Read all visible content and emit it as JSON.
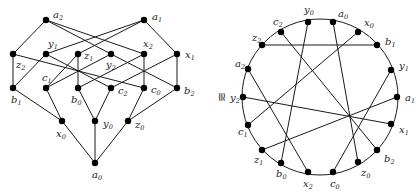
{
  "figure": {
    "relation_symbol": "≅",
    "left_graph": {
      "type": "lattice",
      "vertices": [
        {
          "id": "a2",
          "base": "a",
          "sub": "2",
          "x": 46,
          "y": 20,
          "lx": 53,
          "ly": 18
        },
        {
          "id": "a1",
          "base": "a",
          "sub": "1",
          "x": 144,
          "y": 20,
          "lx": 152,
          "ly": 20
        },
        {
          "id": "z2",
          "base": "z",
          "sub": "2",
          "x": 13,
          "y": 54,
          "lx": 16,
          "ly": 68
        },
        {
          "id": "y1",
          "base": "y",
          "sub": "1",
          "x": 46,
          "y": 54,
          "lx": 48,
          "ly": 47
        },
        {
          "id": "z1",
          "base": "z",
          "sub": "1",
          "x": 78,
          "y": 54,
          "lx": 84,
          "ly": 59
        },
        {
          "id": "y2",
          "base": "y",
          "sub": "2",
          "x": 111,
          "y": 54,
          "lx": 106,
          "ly": 68
        },
        {
          "id": "x2",
          "base": "x",
          "sub": "2",
          "x": 144,
          "y": 54,
          "lx": 143,
          "ly": 47
        },
        {
          "id": "x1",
          "base": "x",
          "sub": "1",
          "x": 177,
          "y": 54,
          "lx": 185,
          "ly": 58
        },
        {
          "id": "b1",
          "base": "b",
          "sub": "1",
          "x": 13,
          "y": 88,
          "lx": 11,
          "ly": 103
        },
        {
          "id": "c1",
          "base": "c",
          "sub": "1",
          "x": 46,
          "y": 88,
          "lx": 42,
          "ly": 81
        },
        {
          "id": "b0",
          "base": "b",
          "sub": "0",
          "x": 78,
          "y": 88,
          "lx": 71,
          "ly": 103
        },
        {
          "id": "c2",
          "base": "c",
          "sub": "2",
          "x": 111,
          "y": 88,
          "lx": 118,
          "ly": 94
        },
        {
          "id": "c0",
          "base": "c",
          "sub": "0",
          "x": 144,
          "y": 88,
          "lx": 151,
          "ly": 93
        },
        {
          "id": "b2",
          "base": "b",
          "sub": "2",
          "x": 177,
          "y": 88,
          "lx": 184,
          "ly": 94
        },
        {
          "id": "x0",
          "base": "x",
          "sub": "0",
          "x": 62,
          "y": 121,
          "lx": 56,
          "ly": 137
        },
        {
          "id": "y0",
          "base": "y",
          "sub": "0",
          "x": 95,
          "y": 121,
          "lx": 103,
          "ly": 127
        },
        {
          "id": "z0",
          "base": "z",
          "sub": "0",
          "x": 128,
          "y": 121,
          "lx": 135,
          "ly": 128
        },
        {
          "id": "a0",
          "base": "a",
          "sub": "0",
          "x": 95,
          "y": 163,
          "lx": 92,
          "ly": 178
        }
      ],
      "edges": [
        [
          "a2",
          "z2"
        ],
        [
          "a2",
          "y2"
        ],
        [
          "a2",
          "x2"
        ],
        [
          "a1",
          "y1"
        ],
        [
          "a1",
          "z1"
        ],
        [
          "a1",
          "x1"
        ],
        [
          "z2",
          "b1"
        ],
        [
          "z2",
          "c0"
        ],
        [
          "y1",
          "b1"
        ],
        [
          "y1",
          "c2"
        ],
        [
          "z1",
          "b0"
        ],
        [
          "z1",
          "c1"
        ],
        [
          "y2",
          "b2"
        ],
        [
          "y2",
          "c1"
        ],
        [
          "x2",
          "c0"
        ],
        [
          "x2",
          "b0"
        ],
        [
          "x1",
          "b2"
        ],
        [
          "x1",
          "c2"
        ],
        [
          "b1",
          "x0"
        ],
        [
          "c1",
          "x0"
        ],
        [
          "b0",
          "y0"
        ],
        [
          "c2",
          "y0"
        ],
        [
          "c0",
          "z0"
        ],
        [
          "b2",
          "z0"
        ],
        [
          "x0",
          "a0"
        ],
        [
          "y0",
          "a0"
        ],
        [
          "z0",
          "a0"
        ]
      ]
    },
    "right_graph": {
      "type": "circle",
      "center": [
        320,
        97
      ],
      "radius": 78,
      "vertices": [
        {
          "id": "y0",
          "base": "y",
          "sub": "0",
          "x": 308,
          "y": 22,
          "lx": 304,
          "ly": 13
        },
        {
          "id": "a0",
          "base": "a",
          "sub": "0",
          "x": 333,
          "y": 22,
          "lx": 338,
          "ly": 17
        },
        {
          "id": "x0",
          "base": "x",
          "sub": "0",
          "x": 358,
          "y": 32,
          "lx": 364,
          "ly": 26
        },
        {
          "id": "b1",
          "base": "b",
          "sub": "1",
          "x": 377,
          "y": 45,
          "lx": 385,
          "ly": 45
        },
        {
          "id": "y1",
          "base": "y",
          "sub": "1",
          "x": 391,
          "y": 70,
          "lx": 399,
          "ly": 69
        },
        {
          "id": "a1",
          "base": "a",
          "sub": "1",
          "x": 397,
          "y": 97,
          "lx": 405,
          "ly": 101
        },
        {
          "id": "x1",
          "base": "x",
          "sub": "1",
          "x": 391,
          "y": 124,
          "lx": 399,
          "ly": 133
        },
        {
          "id": "b2",
          "base": "b",
          "sub": "2",
          "x": 377,
          "y": 150,
          "lx": 384,
          "ly": 162
        },
        {
          "id": "z0",
          "base": "z",
          "sub": "0",
          "x": 358,
          "y": 162,
          "lx": 361,
          "ly": 176
        },
        {
          "id": "c0",
          "base": "c",
          "sub": "0",
          "x": 333,
          "y": 172,
          "lx": 330,
          "ly": 187
        },
        {
          "id": "x2",
          "base": "x",
          "sub": "2",
          "x": 308,
          "y": 172,
          "lx": 303,
          "ly": 187
        },
        {
          "id": "b0",
          "base": "b",
          "sub": "0",
          "x": 281,
          "y": 163,
          "lx": 276,
          "ly": 177
        },
        {
          "id": "z1",
          "base": "z",
          "sub": "1",
          "x": 262,
          "y": 150,
          "lx": 254,
          "ly": 163
        },
        {
          "id": "c1",
          "base": "c",
          "sub": "1",
          "x": 248,
          "y": 125,
          "lx": 238,
          "ly": 135
        },
        {
          "id": "y2",
          "base": "y",
          "sub": "2",
          "x": 243,
          "y": 97,
          "lx": 230,
          "ly": 101
        },
        {
          "id": "a2",
          "base": "a",
          "sub": "2",
          "x": 248,
          "y": 69,
          "lx": 235,
          "ly": 67
        },
        {
          "id": "z2",
          "base": "z",
          "sub": "2",
          "x": 262,
          "y": 45,
          "lx": 252,
          "ly": 41
        },
        {
          "id": "c2",
          "base": "c",
          "sub": "2",
          "x": 281,
          "y": 32,
          "lx": 273,
          "ly": 25
        }
      ],
      "chords": [
        [
          "z2",
          "b1"
        ],
        [
          "y0",
          "b0"
        ],
        [
          "a0",
          "z0"
        ],
        [
          "c2",
          "b2"
        ],
        [
          "x0",
          "c1"
        ],
        [
          "a2",
          "x2"
        ],
        [
          "y2",
          "x1"
        ],
        [
          "z1",
          "a1"
        ],
        [
          "y1",
          "c0"
        ]
      ]
    }
  }
}
